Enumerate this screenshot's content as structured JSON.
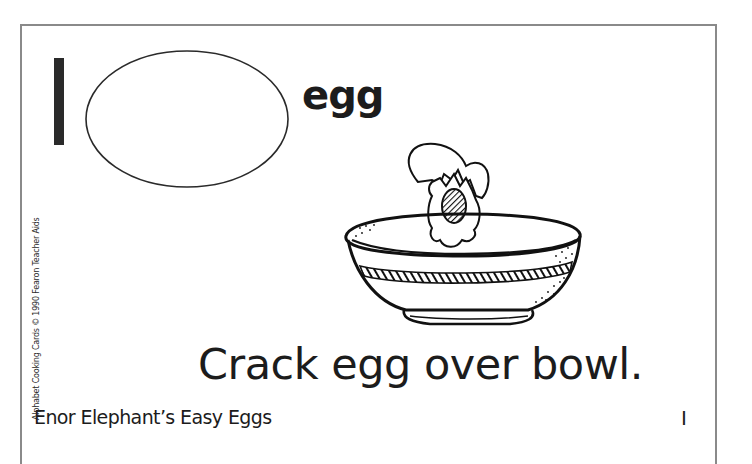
{
  "card": {
    "series": "Alphabet Cooking Cards",
    "letter": "I",
    "word": "egg",
    "instruction": "Crack egg over bowl.",
    "recipe_title": "Enor Elephant’s Easy Eggs",
    "side_credit": "Alphabet Cooking Cards © 1990 Fearon Teacher Aids",
    "illustration": "cracked-egg-over-bowl",
    "colors": {
      "ink": "#1c1c1c",
      "border": "#8a8a8a",
      "background": "#ffffff"
    }
  }
}
